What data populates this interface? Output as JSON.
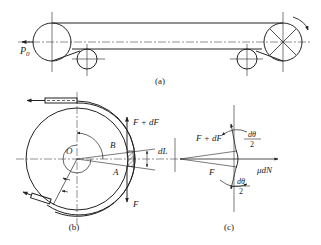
{
  "figure": {
    "panel_a": {
      "caption": "(a)",
      "force_label": "P",
      "force_subscript": "0"
    },
    "panel_b": {
      "caption": "(b)",
      "center_label": "O",
      "point_b": "B",
      "point_a": "A",
      "force_top": "F + dF",
      "force_bottom": "F",
      "segment_label": "dL"
    },
    "panel_c": {
      "caption": "(c)",
      "force_top": "F + dF",
      "force_bottom": "F",
      "friction_label": "μdN",
      "angle_num": "dθ",
      "angle_den": "2"
    }
  },
  "colors": {
    "stroke": "#222222",
    "background": "#ffffff"
  }
}
